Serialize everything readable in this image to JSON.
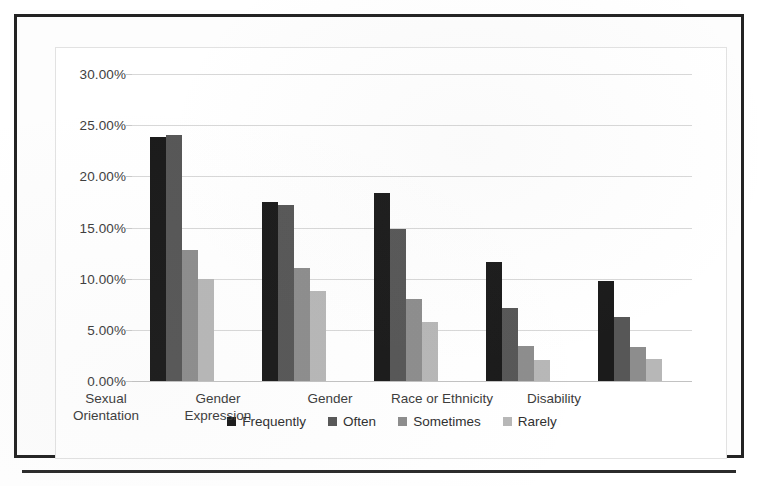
{
  "chart_data": {
    "type": "bar",
    "title": "",
    "subtitle": "",
    "xlabel": "",
    "ylabel": "",
    "ylim": [
      0,
      30
    ],
    "ytick_labels": [
      "30.00%",
      "25.00%",
      "20.00%",
      "15.00%",
      "10.00%",
      "5.00%",
      "0.00%"
    ],
    "ytick_values": [
      30,
      25,
      20,
      15,
      10,
      5,
      0
    ],
    "grid": true,
    "legend_position": "bottom",
    "categories": [
      "Sexual Orientation",
      "Gender Expression",
      "Gender",
      "Race or Ethnicity",
      "Disability"
    ],
    "category_lines": [
      [
        "Sexual",
        "Orientation"
      ],
      [
        "Gender",
        "Expression"
      ],
      [
        "Gender",
        ""
      ],
      [
        "Race or Ethnicity",
        ""
      ],
      [
        "Disability",
        ""
      ]
    ],
    "series": [
      {
        "name": "Frequently",
        "color": "#1b1b1b",
        "values": [
          23.8,
          17.5,
          18.4,
          11.6,
          9.8
        ]
      },
      {
        "name": "Often",
        "color": "#575757",
        "values": [
          24.0,
          17.2,
          14.9,
          7.1,
          6.3
        ]
      },
      {
        "name": "Sometimes",
        "color": "#8d8d8d",
        "values": [
          12.8,
          11.0,
          8.0,
          3.4,
          3.3
        ]
      },
      {
        "name": "Rarely",
        "color": "#b7b7b7",
        "values": [
          10.0,
          8.8,
          5.8,
          2.1,
          2.2
        ]
      }
    ]
  },
  "legend": {
    "items": [
      {
        "label": "Frequently",
        "color": "#1b1b1b"
      },
      {
        "label": "Often",
        "color": "#575757"
      },
      {
        "label": "Sometimes",
        "color": "#8d8d8d"
      },
      {
        "label": "Rarely",
        "color": "#b7b7b7"
      }
    ]
  },
  "colors": {
    "grid": "#d8d8d8",
    "axis_text": "#3e3e3e",
    "page_border": "#232323",
    "chart_border": "#e2e2e2"
  }
}
